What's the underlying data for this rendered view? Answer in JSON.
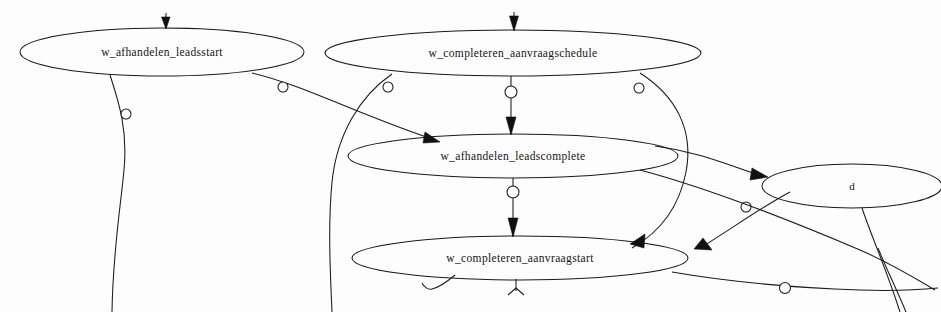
{
  "diagram": {
    "type": "directed-graph",
    "background_color": "#ffffff",
    "stroke_color": "#1a1a1a",
    "width": 941,
    "height": 312
  },
  "nodes": [
    {
      "id": "n1",
      "label": "w_afhandelen_leadsstart",
      "cx": 162,
      "cy": 52,
      "rx": 142,
      "ry": 24
    },
    {
      "id": "n2",
      "label": "w_completeren_aanvraagschedule",
      "cx": 513,
      "cy": 53,
      "rx": 188,
      "ry": 23
    },
    {
      "id": "n3",
      "label": "w_afhandelen_leadscomplete",
      "cx": 513,
      "cy": 156,
      "rx": 165,
      "ry": 22
    },
    {
      "id": "n4",
      "label": "w_completeren_aanvraagstart",
      "cx": 520,
      "cy": 258,
      "rx": 168,
      "ry": 22
    },
    {
      "id": "n5",
      "label": "d",
      "cx": 852,
      "cy": 186,
      "rx": 90,
      "ry": 22
    }
  ],
  "edges": [
    {
      "id": "e-in-n1",
      "from": "source-top",
      "to": "n1",
      "arrow": true,
      "marker": false
    },
    {
      "id": "e-in-n2",
      "from": "source-top",
      "to": "n2",
      "arrow": true,
      "marker": false
    },
    {
      "id": "e-n1-down",
      "from": "n1",
      "to": "bottom-out",
      "arrow": false,
      "marker": true
    },
    {
      "id": "e-n1-n3",
      "from": "n1",
      "to": "n3",
      "arrow": true,
      "marker": true
    },
    {
      "id": "e-n2-n3",
      "from": "n2",
      "to": "n3",
      "arrow": true,
      "marker": true
    },
    {
      "id": "e-n3-n4",
      "from": "n3",
      "to": "n4",
      "arrow": true,
      "marker": true
    },
    {
      "id": "e-n2-n5",
      "from": "n2",
      "to": "n5",
      "arrow": true,
      "marker": true
    },
    {
      "id": "e-n2-n4",
      "from": "n2",
      "to": "n4",
      "arrow": true,
      "marker": false
    },
    {
      "id": "e-n3-n4b",
      "from": "n3",
      "to": "n4",
      "arrow": true,
      "marker": true
    },
    {
      "id": "e-n5-out",
      "from": "n5",
      "to": "bottom-out",
      "arrow": false,
      "marker": false
    },
    {
      "id": "e-n4-out",
      "from": "n4",
      "to": "bottom-out",
      "arrow": false,
      "marker": false
    },
    {
      "id": "e-cross",
      "from": "n5",
      "to": "bottom-left",
      "arrow": false,
      "marker": true
    }
  ],
  "markers": {
    "loop_circle_radius": 5,
    "arrow_length": 11
  }
}
